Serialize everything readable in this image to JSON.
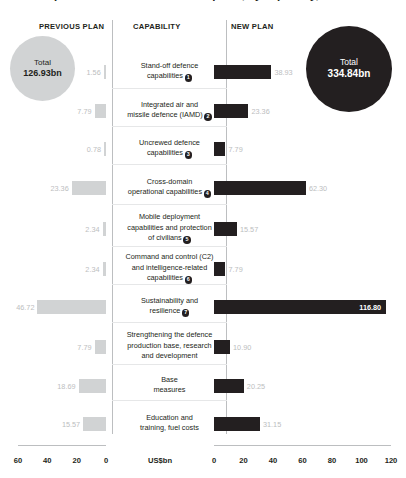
{
  "title": "German procurement and investment plans, by capability, 2025",
  "headers": {
    "previous": "PREVIOUS PLAN",
    "capability": "CAPABILITY",
    "new": "NEW PLAN"
  },
  "totals": {
    "previous": {
      "label": "Total",
      "value": "126.93bn"
    },
    "new": {
      "label": "Total",
      "value": "334.84bn"
    }
  },
  "axis": {
    "unit": "US$bn",
    "left_ticks": [
      "60",
      "40",
      "20",
      "0"
    ],
    "right_ticks": [
      "0",
      "20",
      "40",
      "60",
      "80",
      "100",
      "120"
    ],
    "left_max": 60,
    "right_max": 120
  },
  "colors": {
    "previous_bar": "#d1d3d4",
    "new_bar": "#231f20",
    "value_text": "#bcbec0",
    "rule": "#bcbec0"
  },
  "chart_data": {
    "type": "bar",
    "title": "German procurement and investment plans, by capability, 2025",
    "xlabel": "US$bn",
    "ylabel": "",
    "grid": false,
    "legend_position": "column-headers",
    "categories": [
      "Stand-off defence capabilities",
      "Integrated air and missile defence (IAMD)",
      "Uncrewed defence capabilities",
      "Cross-domain operational capabilities",
      "Mobile deployment capabilities and protection of civilians",
      "Command and control (C2) and intelligence-related capabilities",
      "Sustainability and resilience",
      "Strengthening the defence production base, research and development",
      "Base measures",
      "Education and training, fuel costs"
    ],
    "series": [
      {
        "name": "PREVIOUS PLAN",
        "values": [
          1.56,
          7.79,
          0.78,
          23.36,
          2.34,
          2.34,
          46.72,
          7.79,
          18.69,
          15.57
        ],
        "total": 126.93,
        "axis": "left",
        "xlim": [
          60,
          0
        ]
      },
      {
        "name": "NEW PLAN",
        "values": [
          38.93,
          23.36,
          7.79,
          62.3,
          15.57,
          7.79,
          116.8,
          10.9,
          20.25,
          31.15
        ],
        "total": 334.84,
        "axis": "right",
        "xlim": [
          0,
          120
        ]
      }
    ]
  },
  "rows": [
    {
      "label_lines": [
        "Stand-off defence",
        "capabilities"
      ],
      "badge": "1",
      "prev": "1.56",
      "prev_value": 1.56,
      "new": "38.93",
      "new_value": 38.93
    },
    {
      "label_lines": [
        "Integrated air and",
        "missile defence (IAMD)"
      ],
      "badge": "2",
      "prev": "7.79",
      "prev_value": 7.79,
      "new": "23.36",
      "new_value": 23.36
    },
    {
      "label_lines": [
        "Uncrewed defence",
        "capabilities"
      ],
      "badge": "3",
      "prev": "0.78",
      "prev_value": 0.78,
      "new": "7.79",
      "new_value": 7.79
    },
    {
      "label_lines": [
        "Cross-domain",
        "operational capabilities"
      ],
      "badge": "4",
      "prev": "23.36",
      "prev_value": 23.36,
      "new": "62.30",
      "new_value": 62.3
    },
    {
      "label_lines": [
        "Mobile deployment",
        "capabilities and protection",
        "of civilians"
      ],
      "badge": "5",
      "prev": "2.34",
      "prev_value": 2.34,
      "new": "15.57",
      "new_value": 15.57
    },
    {
      "label_lines": [
        "Command and control (C2)",
        "and intelligence-related",
        "capabilities"
      ],
      "badge": "6",
      "prev": "2.34",
      "prev_value": 2.34,
      "new": "7.79",
      "new_value": 7.79
    },
    {
      "label_lines": [
        "Sustainability and",
        "resilience"
      ],
      "badge": "7",
      "prev": "46.72",
      "prev_value": 46.72,
      "new": "116.80",
      "new_value": 116.8
    },
    {
      "label_lines": [
        "Strengthening the defence",
        "production base, research",
        "and development"
      ],
      "badge": "",
      "prev": "7.79",
      "prev_value": 7.79,
      "new": "10.90",
      "new_value": 10.9
    },
    {
      "label_lines": [
        "Base",
        "measures"
      ],
      "badge": "",
      "prev": "18.69",
      "prev_value": 18.69,
      "new": "20.25",
      "new_value": 20.25
    },
    {
      "label_lines": [
        "Education and",
        "training, fuel costs"
      ],
      "badge": "",
      "prev": "15.57",
      "prev_value": 15.57,
      "new": "31.15",
      "new_value": 31.15
    }
  ]
}
